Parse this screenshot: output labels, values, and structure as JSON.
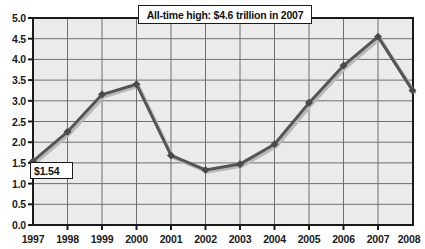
{
  "chart_data": {
    "type": "line",
    "title": "",
    "subtitle": "",
    "xlabel": "",
    "ylabel": "",
    "categories": [
      "1997",
      "1998",
      "1999",
      "2000",
      "2001",
      "2002",
      "2003",
      "2004",
      "2005",
      "2006",
      "2007",
      "2008"
    ],
    "x": [
      1997,
      1998,
      1999,
      2000,
      2001,
      2002,
      2003,
      2004,
      2005,
      2006,
      2007,
      2008
    ],
    "values": [
      1.54,
      2.25,
      3.15,
      3.4,
      1.68,
      1.33,
      1.47,
      1.95,
      2.95,
      3.85,
      4.55,
      3.25
    ],
    "series": [
      {
        "name": "Value (trillions of dollars)",
        "values": [
          1.54,
          2.25,
          3.15,
          3.4,
          1.68,
          1.33,
          1.47,
          1.95,
          2.95,
          3.85,
          4.55,
          3.25
        ]
      }
    ],
    "ylim": [
      0.0,
      5.0
    ],
    "ytick_step": 0.5,
    "ytick_labels": [
      "0.0",
      "0.5",
      "1.0",
      "1.5",
      "2.0",
      "2.5",
      "3.0",
      "3.5",
      "4.0",
      "4.5",
      "5.0"
    ],
    "xtick_labels": [
      "1997",
      "1998",
      "1999",
      "2000",
      "2001",
      "2002",
      "2003",
      "2004",
      "2005",
      "2006",
      "2007",
      "2008"
    ],
    "grid": true,
    "grid_horizontal": true,
    "grid_vertical": true,
    "legend": false,
    "legend_position": "none",
    "marker": "diamond",
    "line_color": "#555555",
    "plot_background": "#ebebeb",
    "grid_color": "#6f6f6f",
    "annotations": [
      {
        "id": "all-time-high",
        "text": "All-time high: $4.6 trillion in 2007",
        "anchor_x": 2007,
        "anchor_y": 4.6
      },
      {
        "id": "first-value",
        "text": "$1.54",
        "anchor_x": 1997,
        "anchor_y": 1.54
      }
    ]
  },
  "axis": {
    "y_ticks": [
      {
        "label": "5.0",
        "value": 5.0
      },
      {
        "label": "4.5",
        "value": 4.5
      },
      {
        "label": "4.0",
        "value": 4.0
      },
      {
        "label": "3.5",
        "value": 3.5
      },
      {
        "label": "3.0",
        "value": 3.0
      },
      {
        "label": "2.5",
        "value": 2.5
      },
      {
        "label": "2.0",
        "value": 2.0
      },
      {
        "label": "1.5",
        "value": 1.5
      },
      {
        "label": "1.0",
        "value": 1.0
      },
      {
        "label": "0.5",
        "value": 0.5
      },
      {
        "label": "0.0",
        "value": 0.0
      }
    ],
    "x_ticks": [
      {
        "label": "1997"
      },
      {
        "label": "1998"
      },
      {
        "label": "1999"
      },
      {
        "label": "2000"
      },
      {
        "label": "2001"
      },
      {
        "label": "2002"
      },
      {
        "label": "2003"
      },
      {
        "label": "2004"
      },
      {
        "label": "2005"
      },
      {
        "label": "2006"
      },
      {
        "label": "2007"
      },
      {
        "label": "2008"
      }
    ]
  },
  "callouts": {
    "annotation": "All-time high: $4.6 trillion in 2007",
    "first_value": "$1.54"
  },
  "colors": {
    "line": "#555555",
    "shadow": "#b9b9b9",
    "plot_bg": "#ebebeb",
    "grid": "#6f6f6f",
    "axis": "#1a1a1a",
    "text": "#1a1a1a",
    "page_bg": "#ffffff"
  }
}
